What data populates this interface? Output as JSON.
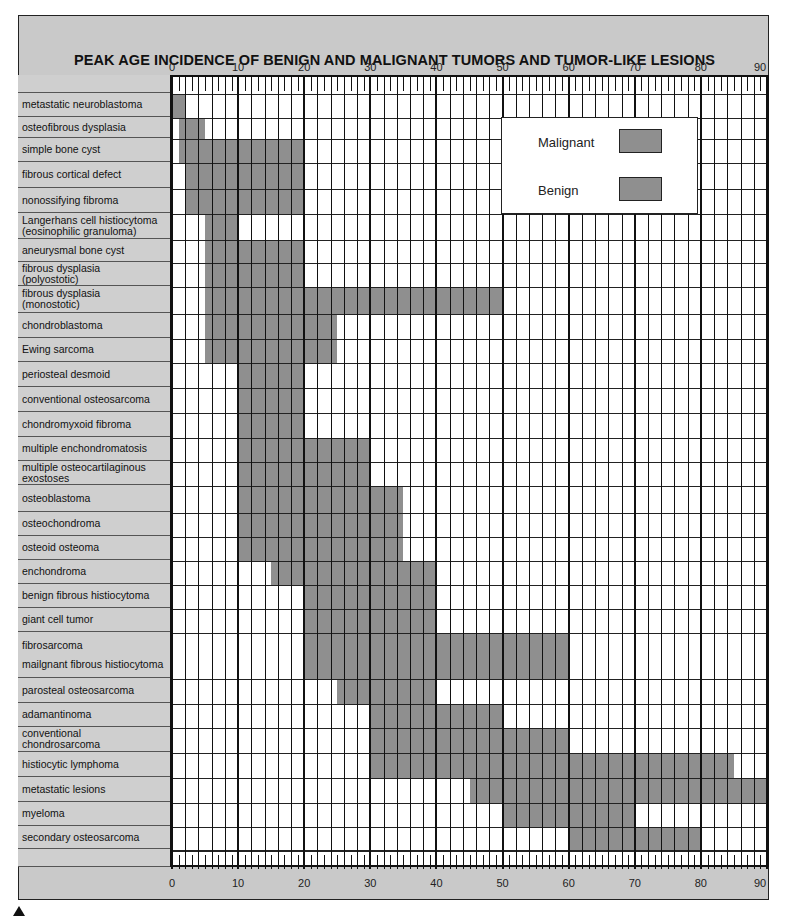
{
  "chart_data": {
    "type": "bar",
    "orientation": "horizontal-range",
    "title": "PEAK AGE INCIDENCE OF BENIGN AND MALIGNANT TUMORS AND TUMOR-LIKE LESIONS",
    "xlabel": "",
    "ylabel": "",
    "xlim": [
      0,
      90
    ],
    "x_ticks": [
      "0",
      "10",
      "20",
      "30",
      "40",
      "50",
      "60",
      "70",
      "80",
      "90"
    ],
    "grid": true,
    "legend": {
      "position": "upper-right inside plot",
      "entries": [
        {
          "label": "Malignant",
          "color": "#8f8f8f"
        },
        {
          "label": "Benign",
          "color": "#8f8f8f"
        }
      ]
    },
    "categories": [
      "metastatic neuroblastoma",
      "osteofibrous dysplasia",
      "simple bone cyst",
      "fibrous cortical defect",
      "nonossifying fibroma",
      "Langerhans cell histiocytoma (eosinophilic granuloma)",
      "aneurysmal bone cyst",
      "fibrous dysplasia (polyostotic)",
      "fibrous dysplasia (monostotic)",
      "chondroblastoma",
      "Ewing sarcoma",
      "periosteal desmoid",
      "conventional osteosarcoma",
      "chondromyxoid fibroma",
      "multiple enchondromatosis",
      "multiple osteocartilaginous exostoses",
      "osteoblastoma",
      "osteochondroma",
      "osteoid osteoma",
      "enchondroma",
      "benign fibrous histiocytoma",
      "giant cell tumor",
      "fibrosarcoma / mailgnant fibrous histiocytoma",
      "parosteal osteosarcoma",
      "adamantinoma",
      "conventional chondrosarcoma",
      "histiocytic lymphoma",
      "metastatic lesions",
      "myeloma",
      "secondary osteosarcoma"
    ],
    "series": [
      {
        "name": "Peak age range (years)",
        "ranges": [
          [
            0,
            2
          ],
          [
            1,
            5
          ],
          [
            1,
            20
          ],
          [
            2,
            20
          ],
          [
            2,
            20
          ],
          [
            5,
            10
          ],
          [
            5,
            20
          ],
          [
            5,
            20
          ],
          [
            5,
            50
          ],
          [
            5,
            25
          ],
          [
            5,
            25
          ],
          [
            10,
            20
          ],
          [
            10,
            20
          ],
          [
            10,
            20
          ],
          [
            10,
            30
          ],
          [
            10,
            30
          ],
          [
            10,
            35
          ],
          [
            10,
            35
          ],
          [
            10,
            35
          ],
          [
            15,
            40
          ],
          [
            20,
            40
          ],
          [
            20,
            40
          ],
          [
            20,
            60
          ],
          [
            25,
            40
          ],
          [
            30,
            50
          ],
          [
            30,
            60
          ],
          [
            30,
            85
          ],
          [
            45,
            90
          ],
          [
            50,
            70
          ],
          [
            60,
            80
          ]
        ]
      }
    ]
  },
  "rows": [
    {
      "line1": "metastatic neuroblastoma",
      "line2": "",
      "h": 24
    },
    {
      "line1": "osteofibrous dysplasia",
      "line2": "",
      "h": 21
    },
    {
      "line1": "simple bone cyst",
      "line2": "",
      "h": 24
    },
    {
      "line1": "fibrous cortical defect",
      "line2": "",
      "h": 26
    },
    {
      "line1": "nonossifying fibroma",
      "line2": "",
      "h": 25
    },
    {
      "line1": "Langerhans cell histiocytoma",
      "line2": "(eosinophilic granuloma)",
      "h": 26
    },
    {
      "line1": "aneurysmal bone cyst",
      "line2": "",
      "h": 23
    },
    {
      "line1": "fibrous dysplasia",
      "line2": "(polyostotic)",
      "h": 24
    },
    {
      "line1": "fibrous dysplasia",
      "line2": "(monostotic)",
      "h": 27
    },
    {
      "line1": "chondroblastoma",
      "line2": "",
      "h": 25
    },
    {
      "line1": "Ewing sarcoma",
      "line2": "",
      "h": 24
    },
    {
      "line1": "periosteal desmoid",
      "line2": "",
      "h": 25
    },
    {
      "line1": "conventional osteosarcoma",
      "line2": "",
      "h": 25
    },
    {
      "line1": "chondromyxoid fibroma",
      "line2": "",
      "h": 25
    },
    {
      "line1": "multiple enchondromatosis",
      "line2": "",
      "h": 24
    },
    {
      "line1": "multiple osteocartilaginous",
      "line2": "exostoses",
      "h": 24
    },
    {
      "line1": "osteoblastoma",
      "line2": "",
      "h": 27
    },
    {
      "line1": "osteochondroma",
      "line2": "",
      "h": 24
    },
    {
      "line1": "osteoid osteoma",
      "line2": "",
      "h": 24
    },
    {
      "line1": "enchondroma",
      "line2": "",
      "h": 24
    },
    {
      "line1": "benign fibrous histiocytoma",
      "line2": "",
      "h": 24
    },
    {
      "line1": "giant cell tumor",
      "line2": "",
      "h": 24
    },
    {
      "line1": "fibrosarcoma",
      "line2": "mailgnant fibrous histiocytoma",
      "h": 46
    },
    {
      "line1": "parosteal osteosarcoma",
      "line2": "",
      "h": 25
    },
    {
      "line1": "adamantinoma",
      "line2": "",
      "h": 24
    },
    {
      "line1": "conventional",
      "line2": "chondrosarcoma",
      "h": 25
    },
    {
      "line1": "histiocytic lymphoma",
      "line2": "",
      "h": 25
    },
    {
      "line1": "metastatic lesions",
      "line2": "",
      "h": 25
    },
    {
      "line1": "myeloma",
      "line2": "",
      "h": 24
    },
    {
      "line1": "secondary osteosarcoma",
      "line2": "",
      "h": 23
    }
  ],
  "legend": {
    "malignant_label": "Malignant",
    "benign_label": "Benign"
  },
  "colors": {
    "bar": "#8f8f8f",
    "frame": "#c9c9c9",
    "plot_bg": "#ffffff"
  }
}
